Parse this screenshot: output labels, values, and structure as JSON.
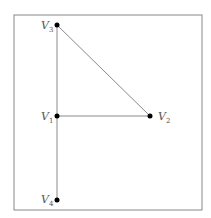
{
  "diagram": {
    "type": "graph",
    "frame": {
      "x": 14,
      "y": 15,
      "w": 188,
      "h": 195,
      "stroke": "#888888"
    },
    "edge_color": "#8a8a8a",
    "node_color": "#000000",
    "label_color": "#555555",
    "nodes": [
      {
        "id": "v1",
        "label": "V",
        "sub": "1",
        "x": 57,
        "y": 116
      },
      {
        "id": "v2",
        "label": "V",
        "sub": "2",
        "x": 150,
        "y": 116
      },
      {
        "id": "v3",
        "label": "V",
        "sub": "3",
        "x": 57,
        "y": 25
      },
      {
        "id": "v4",
        "label": "V",
        "sub": "4",
        "x": 57,
        "y": 200
      }
    ],
    "edges": [
      {
        "from": "v3",
        "to": "v1"
      },
      {
        "from": "v1",
        "to": "v4"
      },
      {
        "from": "v1",
        "to": "v2"
      },
      {
        "from": "v3",
        "to": "v2"
      }
    ]
  }
}
